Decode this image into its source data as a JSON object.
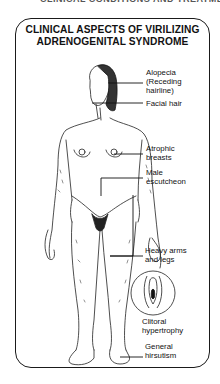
{
  "top_cut_text": "CLINICAL CONDITIONS AND TREATMENT",
  "figure": {
    "title_line1": "CLINICAL ASPECTS OF VIRILIZING",
    "title_line2": "ADRENOGENITAL SYNDROME",
    "labels": {
      "alopecia_line1": "Alopecia",
      "alopecia_line2": "(Receding",
      "alopecia_line3": "hairline)",
      "facial_hair": "Facial hair",
      "atrophic_line1": "Atrophic",
      "atrophic_line2": "breasts",
      "male_line1": "Male",
      "male_line2": "escutcheon",
      "heavy_line1": "Heavy arms",
      "heavy_line2": "and legs",
      "clitoral_line1": "Clitoral",
      "clitoral_line2": "hypertrophy",
      "general_line1": "General",
      "general_line2": "hirsutism"
    }
  }
}
